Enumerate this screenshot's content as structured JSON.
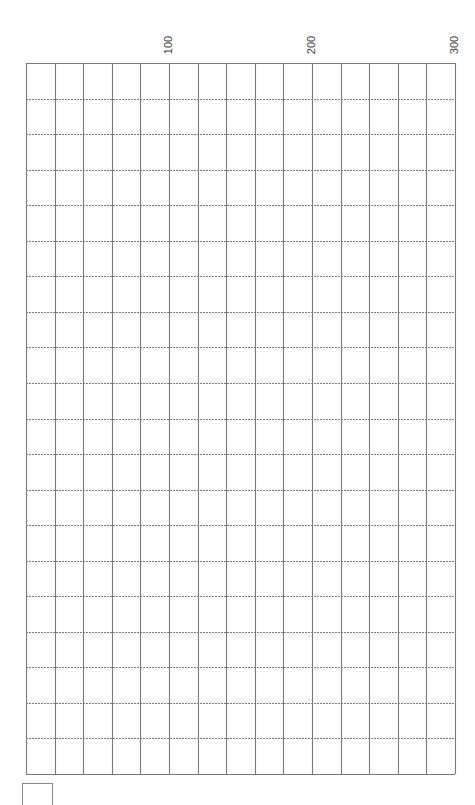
{
  "chart_data": {
    "type": "heatmap",
    "title": "",
    "xlabel": "",
    "ylabel": "",
    "xlim": [
      0,
      300
    ],
    "x_ticks": [
      100,
      200,
      300
    ],
    "x_tick_labels": [
      "100",
      "200",
      "300"
    ],
    "columns": 15,
    "rows": 20,
    "grid": true,
    "vertical_line_style": "solid",
    "horizontal_line_style": "dashed",
    "series": []
  },
  "axis": {
    "labels": [
      "100",
      "200",
      "300"
    ]
  },
  "colors": {
    "background": "#ffffff",
    "grid_line": "#7a7a7a",
    "text": "#444444"
  }
}
